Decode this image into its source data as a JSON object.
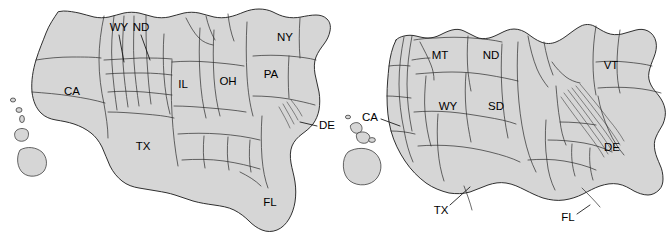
{
  "figure": {
    "type": "cartogram-pair",
    "background_color": "#ffffff",
    "land_fill_color": "#d6d6d6",
    "border_color": "#1a1a1a",
    "label_color": "#000000"
  },
  "panels": [
    {
      "id": "left",
      "name": "left-cartogram",
      "labels": [
        {
          "id": "ca",
          "text": "CA",
          "x": 72,
          "y": 92,
          "leader": false
        },
        {
          "id": "wy",
          "text": "WY",
          "x": 119,
          "y": 28,
          "leader": true,
          "lx1": 119,
          "ly1": 35,
          "lx2": 124,
          "ly2": 62
        },
        {
          "id": "nd",
          "text": "ND",
          "x": 141,
          "y": 28,
          "leader": true,
          "lx1": 141,
          "ly1": 35,
          "lx2": 150,
          "ly2": 60
        },
        {
          "id": "tx",
          "text": "TX",
          "x": 143,
          "y": 147,
          "leader": false
        },
        {
          "id": "il",
          "text": "IL",
          "x": 183,
          "y": 85,
          "leader": false
        },
        {
          "id": "oh",
          "text": "OH",
          "x": 228,
          "y": 82,
          "leader": false
        },
        {
          "id": "pa",
          "text": "PA",
          "x": 271,
          "y": 75,
          "leader": false
        },
        {
          "id": "ny",
          "text": "NY",
          "x": 285,
          "y": 38,
          "leader": false
        },
        {
          "id": "fl",
          "text": "FL",
          "x": 270,
          "y": 203,
          "leader": false
        },
        {
          "id": "de",
          "text": "DE",
          "x": 327,
          "y": 126,
          "leader": true,
          "lx1": 317,
          "ly1": 126,
          "lx2": 300,
          "ly2": 122
        }
      ]
    },
    {
      "id": "right",
      "name": "right-cartogram",
      "labels": [
        {
          "id": "ca2",
          "text": "CA",
          "x": 370,
          "y": 118,
          "leader": true,
          "lx1": 381,
          "ly1": 119,
          "lx2": 400,
          "ly2": 126
        },
        {
          "id": "mt",
          "text": "MT",
          "x": 440,
          "y": 56,
          "leader": false
        },
        {
          "id": "nd2",
          "text": "ND",
          "x": 491,
          "y": 56,
          "leader": false
        },
        {
          "id": "wy2",
          "text": "WY",
          "x": 448,
          "y": 107,
          "leader": false
        },
        {
          "id": "sd",
          "text": "SD",
          "x": 496,
          "y": 107,
          "leader": false
        },
        {
          "id": "vt",
          "text": "VT",
          "x": 611,
          "y": 66,
          "leader": false
        },
        {
          "id": "tx2",
          "text": "TX",
          "x": 441,
          "y": 211,
          "leader": true,
          "lx1": 450,
          "ly1": 205,
          "lx2": 470,
          "ly2": 187
        },
        {
          "id": "de2",
          "text": "DE",
          "x": 612,
          "y": 148,
          "leader": false
        },
        {
          "id": "fl2",
          "text": "FL",
          "x": 568,
          "y": 218,
          "leader": true,
          "lx1": 577,
          "ly1": 214,
          "lx2": 590,
          "ly2": 205
        }
      ]
    }
  ]
}
